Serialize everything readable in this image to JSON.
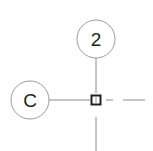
{
  "drawing": {
    "type": "structural-grid-plan",
    "colors": {
      "background": "#ffffff",
      "grid_line": "#8a8a8a",
      "bubble_stroke": "#9a9a9a",
      "column_marker": "#222222",
      "label": "#222222"
    },
    "grid_bubbles": [
      {
        "id": "vertical-grid",
        "label": "2",
        "cx": 96,
        "cy": 39,
        "r": 19
      },
      {
        "id": "horizontal-grid",
        "label": "C",
        "cx": 30,
        "cy": 100,
        "r": 19
      }
    ],
    "column_marker": {
      "grid_ref": "C-2",
      "x": 91,
      "y": 95,
      "size": 10
    }
  }
}
